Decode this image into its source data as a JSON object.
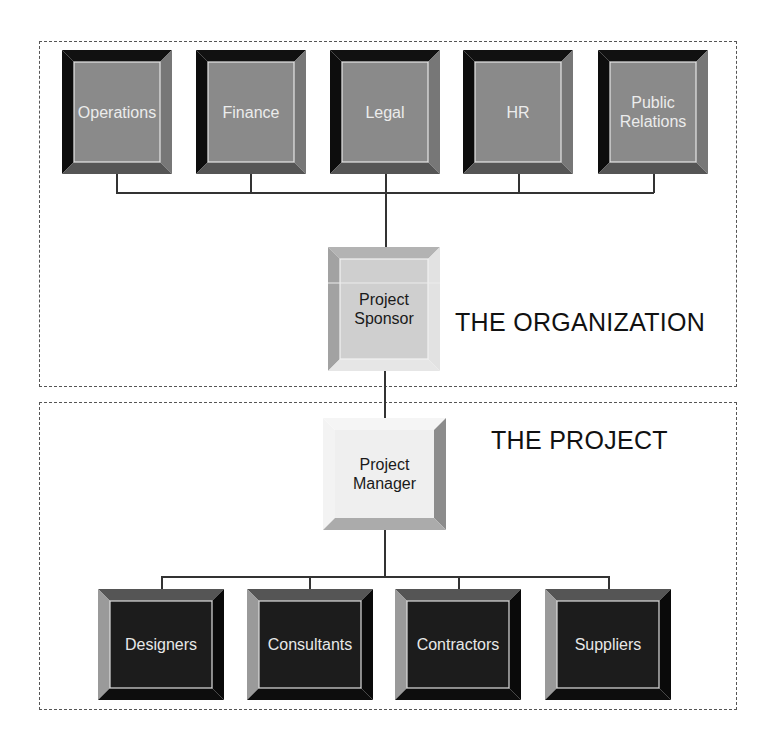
{
  "regions": {
    "organization": {
      "label": "THE ORGANIZATION"
    },
    "project": {
      "label": "THE PROJECT"
    }
  },
  "departments": [
    {
      "label": "Operations"
    },
    {
      "label": "Finance"
    },
    {
      "label": "Legal"
    },
    {
      "label": "HR"
    },
    {
      "label": "Public\nRelations"
    }
  ],
  "sponsor": {
    "label": "Project\nSponsor"
  },
  "manager": {
    "label": "Project\nManager"
  },
  "teams": [
    {
      "label": "Designers"
    },
    {
      "label": "Consultants"
    },
    {
      "label": "Contractors"
    },
    {
      "label": "Suppliers"
    }
  ],
  "colors": {
    "department_face": "#8a8a8a",
    "team_face": "#1c1c1c",
    "sponsor_face": "#cfcfcf",
    "manager_face": "#f0f0f0",
    "connector": "#333333"
  }
}
